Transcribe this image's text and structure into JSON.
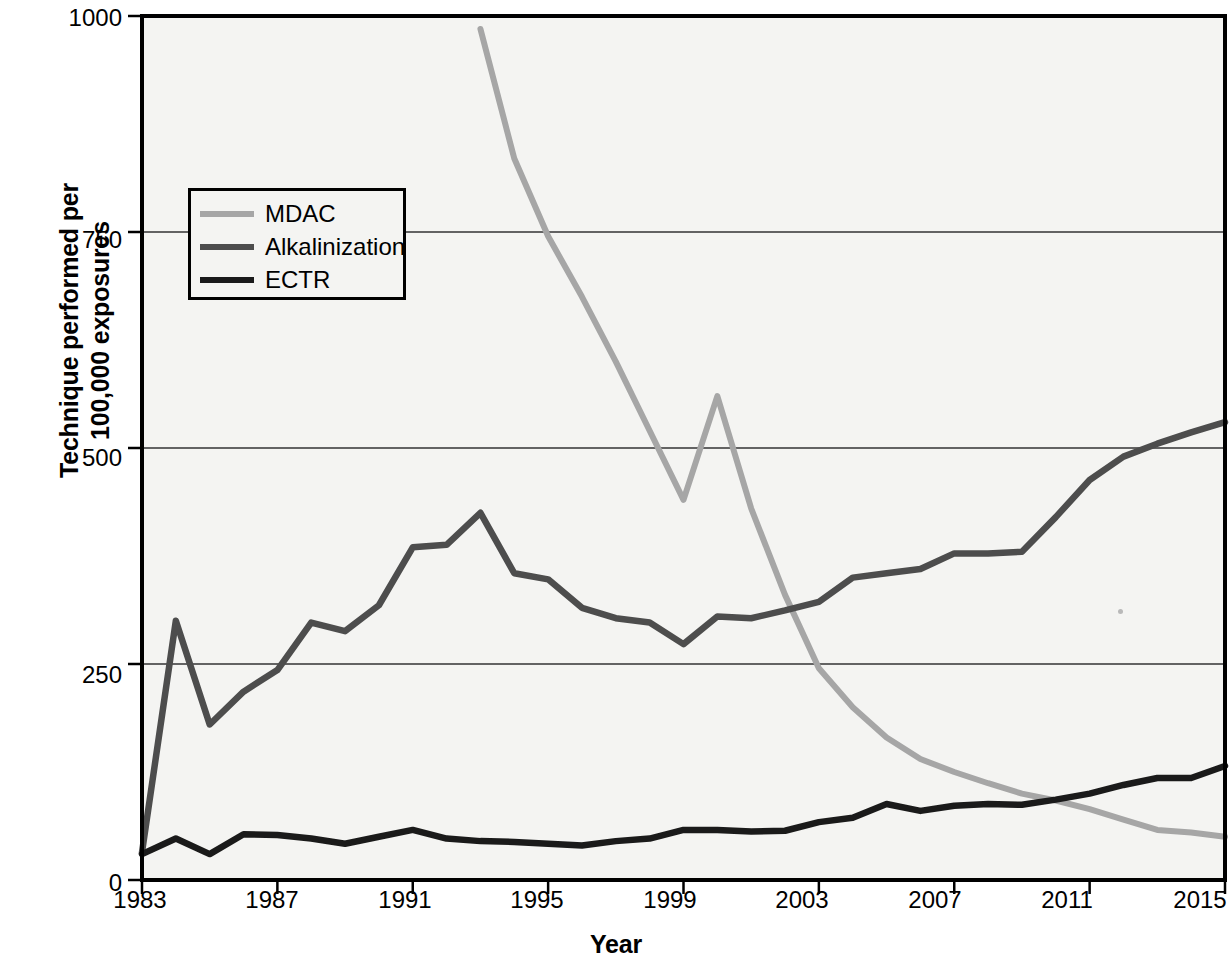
{
  "chart_data": {
    "type": "line",
    "title": "",
    "xlabel": "Year",
    "ylabel": "Technique performed per 100,000 exposures",
    "ylabel_line1": "Technique performed per",
    "ylabel_line2": "100,000 exposures",
    "xlim": [
      1983,
      2015
    ],
    "ylim": [
      0,
      1000
    ],
    "grid": true,
    "legend_position": "top-left-inside",
    "yticks": [
      0,
      250,
      500,
      750,
      1000
    ],
    "ytick_labels": [
      "0",
      "250",
      "500",
      "750",
      "1000"
    ],
    "xticks": [
      1983,
      1987,
      1991,
      1995,
      1999,
      2003,
      2007,
      2011,
      2015
    ],
    "xtick_labels": [
      "1983",
      "1987",
      "1991",
      "1995",
      "1999",
      "2003",
      "2007",
      "2011",
      "2015"
    ],
    "x": [
      1983,
      1984,
      1985,
      1986,
      1987,
      1988,
      1989,
      1990,
      1991,
      1992,
      1993,
      1994,
      1995,
      1996,
      1997,
      1998,
      1999,
      2000,
      2001,
      2002,
      2003,
      2004,
      2005,
      2006,
      2007,
      2008,
      2009,
      2010,
      2011,
      2012,
      2013,
      2014,
      2015
    ],
    "series": [
      {
        "name": "MDAC",
        "color": "#a6a6a6",
        "x": [
          1993,
          1994,
          1995,
          1996,
          1997,
          1998,
          1999,
          2000,
          2001,
          2002,
          2003,
          2004,
          2005,
          2006,
          2007,
          2008,
          2009,
          2010,
          2011,
          2012,
          2013,
          2014,
          2015
        ],
        "values": [
          985,
          835,
          745,
          675,
          600,
          520,
          440,
          560,
          430,
          330,
          245,
          200,
          165,
          140,
          125,
          112,
          100,
          92,
          82,
          70,
          58,
          55,
          50
        ]
      },
      {
        "name": "Alkalinization",
        "color": "#4d4d4d",
        "x": [
          1983,
          1984,
          1985,
          1986,
          1987,
          1988,
          1989,
          1990,
          1991,
          1992,
          1993,
          1994,
          1995,
          1996,
          1997,
          1998,
          1999,
          2000,
          2001,
          2002,
          2003,
          2004,
          2005,
          2006,
          2007,
          2008,
          2009,
          2010,
          2011,
          2012,
          2013,
          2014,
          2015
        ],
        "values": [
          32,
          300,
          180,
          218,
          243,
          298,
          288,
          318,
          385,
          388,
          425,
          355,
          348,
          315,
          303,
          298,
          273,
          305,
          303,
          312,
          322,
          350,
          355,
          360,
          378,
          378,
          380,
          420,
          463,
          490,
          505,
          518,
          530
        ]
      },
      {
        "name": "ECTR",
        "color": "#1a1a1a",
        "x": [
          1983,
          1984,
          1985,
          1986,
          1987,
          1988,
          1989,
          1990,
          1991,
          1992,
          1993,
          1994,
          1995,
          1996,
          1997,
          1998,
          1999,
          2000,
          2001,
          2002,
          2003,
          2004,
          2005,
          2006,
          2007,
          2008,
          2009,
          2010,
          2011,
          2012,
          2013,
          2014,
          2015
        ],
        "values": [
          30,
          48,
          30,
          53,
          52,
          48,
          42,
          50,
          58,
          48,
          45,
          44,
          42,
          40,
          45,
          48,
          58,
          58,
          56,
          57,
          67,
          72,
          88,
          80,
          86,
          88,
          87,
          93,
          100,
          110,
          118,
          118,
          132
        ]
      }
    ]
  },
  "legend": {
    "items": [
      {
        "label": "MDAC",
        "color": "#a6a6a6"
      },
      {
        "label": "Alkalinization",
        "color": "#4d4d4d"
      },
      {
        "label": "ECTR",
        "color": "#1a1a1a"
      }
    ]
  },
  "axes": {
    "frame_color": "#000000",
    "grid_color": "#333333",
    "plot_bg": "#f4f4f2"
  }
}
